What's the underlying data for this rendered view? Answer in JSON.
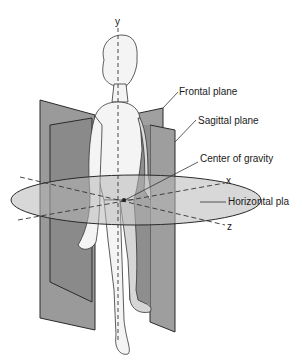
{
  "diagram": {
    "axes": [
      {
        "id": "y",
        "label": "y"
      },
      {
        "id": "x",
        "label": "x"
      },
      {
        "id": "z",
        "label": "z"
      }
    ],
    "labels": {
      "frontal": "Frontal plane",
      "sagittal": "Sagittal plane",
      "cog": "Center of gravity",
      "horizontal": "Horizontal pla"
    },
    "colors": {
      "plane_dark": "#8c8c8c",
      "plane_light": "#b4b4b4",
      "outline": "#2a2a2a",
      "background": "#ffffff"
    }
  }
}
